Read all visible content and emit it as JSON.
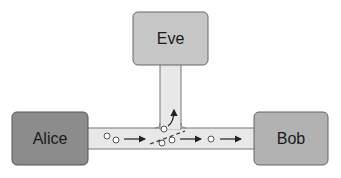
{
  "diagram": {
    "nodes": [
      {
        "id": "alice",
        "label": "Alice",
        "color": "#8c8c8c"
      },
      {
        "id": "eve",
        "label": "Eve",
        "color": "#c6c6c6"
      },
      {
        "id": "bob",
        "label": "Bob",
        "color": "#b2b2b2"
      }
    ],
    "channel_color": "#e8e8e8",
    "edges": [
      {
        "from": "alice",
        "to": "bob",
        "description": "photon stream channel"
      },
      {
        "from": "channel",
        "to": "eve",
        "description": "eavesdropper tap (beam splitter)"
      }
    ]
  }
}
